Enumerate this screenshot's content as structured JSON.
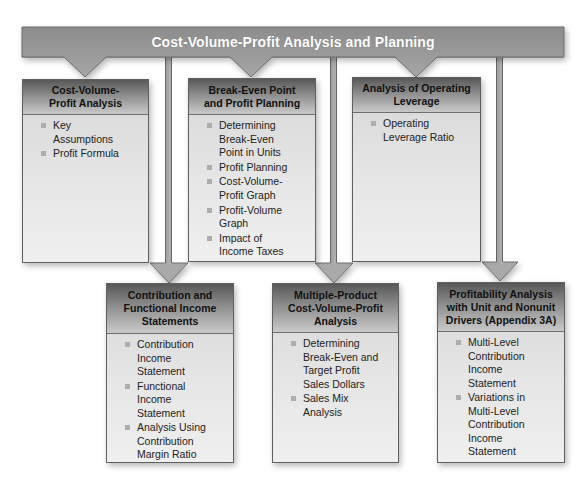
{
  "diagram": {
    "title": "Cost-Volume-Profit Analysis and Planning",
    "top_topics": [
      {
        "title": "Cost-Volume-\nProfit Analysis",
        "items": [
          "Key\nAssumptions",
          "Profit Formula"
        ]
      },
      {
        "title": "Break-Even Point\nand Profit Planning",
        "items": [
          "Determining\nBreak-Even\nPoint in Units",
          "Profit Planning",
          "Cost-Volume-\nProfit Graph",
          "Profit-Volume\nGraph",
          "Impact of\nIncome Taxes"
        ]
      },
      {
        "title": "Analysis of Operating\nLeverage",
        "items": [
          "Operating\nLeverage Ratio"
        ]
      }
    ],
    "bottom_topics": [
      {
        "title": "Contribution and\nFunctional Income\nStatements",
        "items": [
          "Contribution\nIncome\nStatement",
          "Functional\nIncome\nStatement",
          "Analysis Using\nContribution\nMargin Ratio"
        ]
      },
      {
        "title": "Multiple-Product\nCost-Volume-Profit\nAnalysis",
        "items": [
          "Determining\nBreak-Even and\nTarget Profit\nSales Dollars",
          "Sales Mix\nAnalysis"
        ]
      },
      {
        "title": "Profitability Analysis\nwith Unit and Nonunit\nDrivers (Appendix 3A)",
        "items": [
          "Multi-Level\nContribution\nIncome\nStatement",
          "Variations in\nMulti-Level\nContribution\nIncome\nStatement"
        ]
      }
    ]
  },
  "colors": {
    "banner": "#9a9a9a",
    "connector": "#a8a8a8",
    "outline": "#666666",
    "header_dark": "#585858",
    "header_light": "#c9c9c9",
    "body": "#e2e2e2",
    "bullet": "#adadad"
  }
}
